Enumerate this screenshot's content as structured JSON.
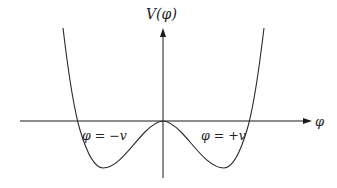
{
  "diagram": {
    "y_axis_label": "V(φ)",
    "x_axis_label": "φ",
    "annotations": [
      {
        "text": "φ = −v",
        "position": "left-minimum-crossing"
      },
      {
        "text": "φ = +v",
        "position": "right-minimum-crossing"
      }
    ],
    "colors": {
      "line": "#2a2a2a",
      "axis": "#1a1a1a",
      "background": "#ffffff"
    }
  }
}
